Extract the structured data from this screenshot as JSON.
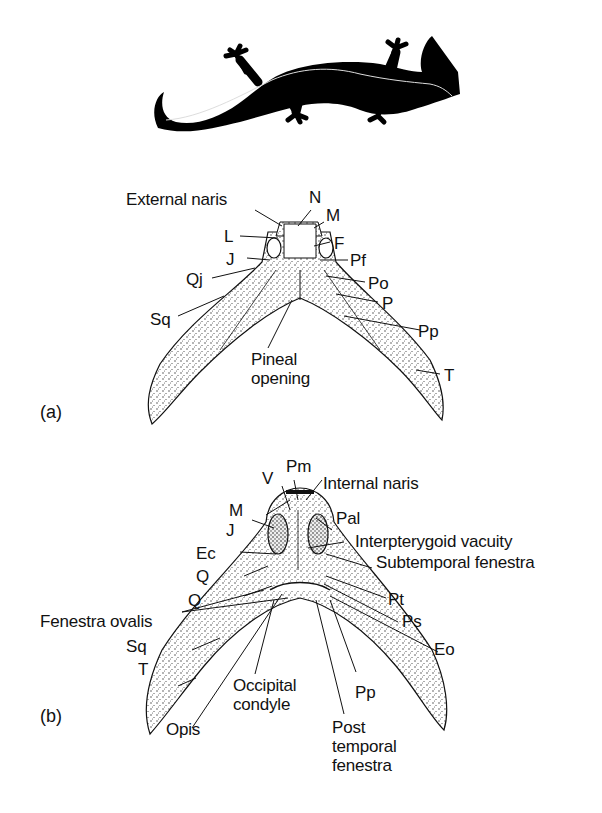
{
  "figure": {
    "icon": "salamander-silhouette",
    "panels": [
      {
        "id": "a",
        "panel_label": "(a)",
        "view": "dorsal skull",
        "labels": {
          "external_naris": "External naris",
          "n": "N",
          "m": "M",
          "l": "L",
          "f": "F",
          "j": "J",
          "pf": "Pf",
          "qj": "Qj",
          "po": "Po",
          "p": "P",
          "sq": "Sq",
          "pp": "Pp",
          "pineal_opening": "Pineal\nopening",
          "t": "T"
        }
      },
      {
        "id": "b",
        "panel_label": "(b)",
        "view": "ventral skull",
        "labels": {
          "v": "V",
          "pm": "Pm",
          "internal_naris": "Internal naris",
          "m": "M",
          "pal": "Pal",
          "j": "J",
          "interpterygoid_vacuity": "Interpterygoid vacuity",
          "ec": "Ec",
          "subtemporal_fenestra": "Subtemporal fenestra",
          "q1": "Q",
          "q2": "Q",
          "pt": "Pt",
          "fenestra_ovalis": "Fenestra ovalis",
          "ps": "Ps",
          "sq": "Sq",
          "eo": "Eo",
          "t": "T",
          "occipital_condyle": "Occipital\ncondyle",
          "pp": "Pp",
          "opis": "Opis",
          "post_temporal_fenestra": "Post\ntemporal\nfenestra"
        }
      }
    ]
  }
}
